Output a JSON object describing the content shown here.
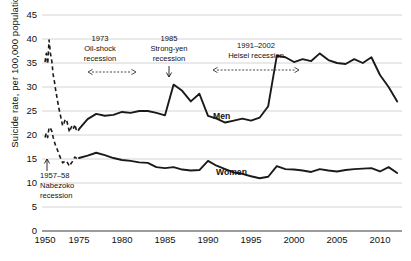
{
  "chart_data": {
    "type": "line",
    "title": "",
    "subtitle": "",
    "xlabel": "",
    "ylabel": "Suicide rate, per 100,000 population",
    "ylim": [
      0,
      45
    ],
    "yticks": [
      0,
      5,
      10,
      15,
      20,
      25,
      30,
      35,
      40,
      45
    ],
    "xticks": [
      1950,
      1975,
      1980,
      1985,
      1990,
      1995,
      2000,
      2005,
      2010
    ],
    "xlim": [
      1950,
      2013
    ],
    "axis_break": "x-axis is broken between 1950 and 1975",
    "grid": "horizontal",
    "legend_position": "inline-labels",
    "line_color": "#1a1a1a",
    "grid_color": "#c9c9c9",
    "series": [
      {
        "name": "Men",
        "label": "Men",
        "style_early": "dashed",
        "style_late": "solid",
        "x": [
          1950,
          1951,
          1952,
          1953,
          1954,
          1955,
          1956,
          1957,
          1958,
          1959,
          1960,
          1961,
          1962,
          1963,
          1964,
          1965,
          1966,
          1967,
          1968,
          1969,
          1970,
          1971,
          1972,
          1973,
          1974,
          1975,
          1976,
          1977,
          1978,
          1979,
          1980,
          1981,
          1982,
          1983,
          1984,
          1985,
          1986,
          1987,
          1988,
          1989,
          1990,
          1991,
          1992,
          1993,
          1994,
          1995,
          1996,
          1997,
          1998,
          1999,
          2000,
          2001,
          2002,
          2003,
          2004,
          2005,
          2006,
          2007,
          2008,
          2009,
          2010,
          2011,
          2012
        ],
        "y": [
          35.2,
          37.0,
          34.8,
          39.8,
          37.0,
          35.4,
          32.6,
          31.0,
          29.1,
          27.5,
          25.8,
          24.6,
          23.2,
          21.9,
          22.5,
          23.3,
          23.0,
          21.8,
          20.6,
          21.4,
          22.0,
          21.4,
          22.2,
          21.0,
          20.7,
          21.2,
          23.3,
          24.4,
          24.0,
          24.2,
          24.8,
          24.6,
          25.0,
          25.0,
          24.6,
          24.1,
          30.5,
          29.2,
          27.0,
          28.6,
          24.0,
          23.4,
          22.6,
          23.0,
          23.4,
          23.0,
          23.6,
          26.0,
          36.5,
          36.2,
          35.2,
          35.8,
          35.4,
          37.0,
          35.6,
          35.0,
          34.8,
          35.8,
          35.0,
          36.2,
          32.5,
          30.0,
          27.0
        ]
      },
      {
        "name": "Women",
        "label": "Women",
        "style_early": "dashed",
        "style_late": "solid",
        "x": [
          1950,
          1951,
          1952,
          1953,
          1954,
          1955,
          1956,
          1957,
          1958,
          1959,
          1960,
          1961,
          1962,
          1963,
          1964,
          1965,
          1966,
          1967,
          1968,
          1969,
          1970,
          1971,
          1972,
          1973,
          1974,
          1975,
          1976,
          1977,
          1978,
          1979,
          1980,
          1981,
          1982,
          1983,
          1984,
          1985,
          1986,
          1987,
          1988,
          1989,
          1990,
          1991,
          1992,
          1993,
          1994,
          1995,
          1996,
          1997,
          1998,
          1999,
          2000,
          2001,
          2002,
          2003,
          2004,
          2005,
          2006,
          2007,
          2008,
          2009,
          2010,
          2011,
          2012
        ],
        "y": [
          19.5,
          20.4,
          19.5,
          21.6,
          21.4,
          20.8,
          19.5,
          18.5,
          17.6,
          17.0,
          16.2,
          15.5,
          14.8,
          14.2,
          14.4,
          14.6,
          14.5,
          14.0,
          13.5,
          14.0,
          14.4,
          15.0,
          15.4,
          15.2,
          15.0,
          15.2,
          15.7,
          16.3,
          15.8,
          15.2,
          14.8,
          14.6,
          14.3,
          14.2,
          13.3,
          13.1,
          13.3,
          12.8,
          12.6,
          12.7,
          14.6,
          13.6,
          12.9,
          12.2,
          11.9,
          11.4,
          11.0,
          11.3,
          13.5,
          12.9,
          12.8,
          12.6,
          12.3,
          12.9,
          12.6,
          12.4,
          12.7,
          12.9,
          13.0,
          13.1,
          12.4,
          13.3,
          12.1
        ]
      }
    ],
    "annotations": [
      {
        "id": "oil-shock",
        "year_label": "1973",
        "line1": "Oil-shock",
        "line2": "recession",
        "marker": "double-headed-dashed-arrow"
      },
      {
        "id": "strong-yen",
        "year_label": "1985",
        "line1": "Strong-yen",
        "line2": "recession",
        "marker": "down-arrow"
      },
      {
        "id": "heisei",
        "year_label": "1991–2002",
        "line1": "Heisei recession",
        "line2": "",
        "marker": "double-headed-dashed-arrow"
      },
      {
        "id": "nabezoko",
        "year_label": "1957–58",
        "line1": "Nabezoko",
        "line2": "recession",
        "marker": "up-arrow"
      }
    ]
  },
  "axis": {
    "ylabel": "Suicide rate, per 100,000 population",
    "yticks": [
      "45",
      "40",
      "35",
      "30",
      "25",
      "20",
      "15",
      "10",
      "5",
      "0"
    ],
    "xticks": [
      "1950",
      "1975",
      "1980",
      "1985",
      "1990",
      "1995",
      "2000",
      "2005",
      "2010"
    ]
  },
  "labels": {
    "men": "Men",
    "women": "Women"
  },
  "annotations": {
    "oil_shock": {
      "year": "1973",
      "name1": "Oil-shock",
      "name2": "recession"
    },
    "strong_yen": {
      "year": "1985",
      "name1": "Strong-yen",
      "name2": "recession"
    },
    "heisei": {
      "year": "1991–2002",
      "name1": "Heisei recession"
    },
    "nabezoko": {
      "year": "1957–58",
      "name1": "Nabezoko",
      "name2": "recession"
    }
  }
}
